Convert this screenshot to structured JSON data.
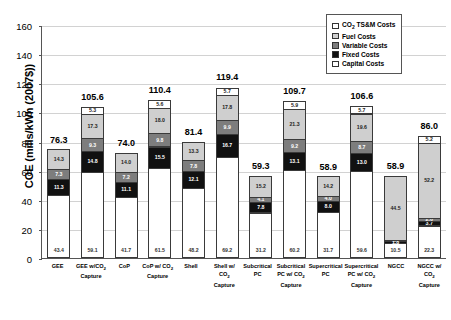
{
  "chart_data": {
    "type": "bar",
    "title": "",
    "xlabel": "",
    "ylabel": "COE (mills/kWh (2007$))",
    "ylim": [
      0,
      160
    ],
    "ytick_labels": [
      "0",
      "20",
      "40",
      "60",
      "80",
      "100",
      "120",
      "140",
      "160"
    ],
    "grid": true,
    "legend_position": "top-right",
    "stacked": true,
    "categories": [
      "GEE",
      "GEE w/CO2 Capture",
      "CoP",
      "CoP w/ CO2 Capture",
      "Shell",
      "Shell w/ CO2 Capture",
      "Subcritical PC",
      "Subcritical PC w/ CO2 Capture",
      "Supercritical PC",
      "Supercritical PC w/ CO2 Capture",
      "NGCC",
      "NGCC w/ CO2 Capture"
    ],
    "totals": [
      76.3,
      105.6,
      74.0,
      110.4,
      81.4,
      119.4,
      59.3,
      109.7,
      58.9,
      106.6,
      58.9,
      86.0
    ],
    "series": [
      {
        "name": "Capital Costs",
        "key": "capital",
        "color": "#ffffff",
        "values": [
          43.4,
          59.1,
          41.7,
          61.5,
          48.2,
          69.2,
          31.2,
          60.2,
          31.7,
          59.6,
          10.5,
          22.3
        ]
      },
      {
        "name": "Fixed Costs",
        "key": "fixed",
        "color": "#111111",
        "values": [
          11.3,
          14.8,
          11.1,
          15.5,
          12.1,
          16.7,
          7.8,
          13.1,
          8.0,
          13.0,
          1.8,
          3.7
        ]
      },
      {
        "name": "Variable Costs",
        "key": "variable",
        "color": "#7d7d7d",
        "values": [
          7.3,
          9.3,
          7.2,
          9.8,
          7.8,
          9.9,
          4.1,
          9.2,
          4.0,
          8.7,
          1.3,
          2.6
        ]
      },
      {
        "name": "Fuel Costs",
        "key": "fuel",
        "color": "#cfcfcf",
        "values": [
          14.3,
          17.3,
          14.0,
          18.0,
          13.3,
          17.8,
          15.2,
          21.3,
          14.2,
          19.6,
          44.5,
          52.2
        ]
      },
      {
        "name": "CO2 TS&M Costs",
        "key": "co2ts",
        "color": "#ffffff",
        "values": [
          0,
          5.3,
          0,
          5.6,
          0,
          5.7,
          0,
          5.9,
          0,
          5.7,
          0,
          5.2
        ]
      }
    ]
  },
  "axis": {
    "ylabel_main": "COE (mills/kWh (2007$))"
  },
  "legend": {
    "items": [
      {
        "label_prefix": "CO",
        "label_sub": "2",
        "label_suffix": " TS&M Costs",
        "key": "co2ts"
      },
      {
        "label_prefix": "Fuel Costs",
        "label_sub": "",
        "label_suffix": "",
        "key": "fuel"
      },
      {
        "label_prefix": "Variable Costs",
        "label_sub": "",
        "label_suffix": "",
        "key": "variable"
      },
      {
        "label_prefix": "Fixed Costs",
        "label_sub": "",
        "label_suffix": "",
        "key": "fixed"
      },
      {
        "label_prefix": "Capital Costs",
        "label_sub": "",
        "label_suffix": "",
        "key": "capital"
      }
    ]
  },
  "xaxis_labels": [
    [
      {
        "t": "GEE"
      }
    ],
    [
      {
        "t": "GEE w/CO"
      },
      {
        "t": "2",
        "sub": true
      },
      {
        "t": ""
      },
      {
        "br": true
      },
      {
        "t": "Capture"
      }
    ],
    [
      {
        "t": "CoP"
      }
    ],
    [
      {
        "t": "CoP w/ CO"
      },
      {
        "t": "2",
        "sub": true
      },
      {
        "br": true
      },
      {
        "t": "Capture"
      }
    ],
    [
      {
        "t": "Shell"
      }
    ],
    [
      {
        "t": "Shell w/"
      },
      {
        "br": true
      },
      {
        "t": "CO"
      },
      {
        "t": "2",
        "sub": true
      },
      {
        "br": true
      },
      {
        "t": "Capture"
      }
    ],
    [
      {
        "t": "Subcritical"
      },
      {
        "br": true
      },
      {
        "t": "PC"
      }
    ],
    [
      {
        "t": "Subcritical"
      },
      {
        "br": true
      },
      {
        "t": "PC w/ CO"
      },
      {
        "t": "2",
        "sub": true
      },
      {
        "br": true
      },
      {
        "t": "Capture"
      }
    ],
    [
      {
        "t": "Supercritical"
      },
      {
        "br": true
      },
      {
        "t": "PC"
      }
    ],
    [
      {
        "t": "Supercritical"
      },
      {
        "br": true
      },
      {
        "t": "PC w/ CO"
      },
      {
        "t": "2",
        "sub": true
      },
      {
        "br": true
      },
      {
        "t": "Capture"
      }
    ],
    [
      {
        "t": "NGCC"
      }
    ],
    [
      {
        "t": "NGCC w/"
      },
      {
        "br": true
      },
      {
        "t": "CO"
      },
      {
        "t": "2",
        "sub": true
      },
      {
        "br": true
      },
      {
        "t": "Capture"
      }
    ]
  ]
}
